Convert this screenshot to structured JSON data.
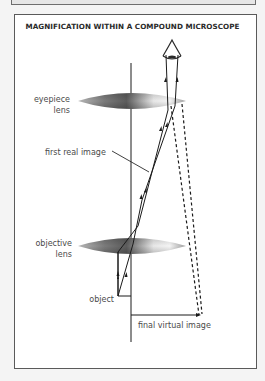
{
  "figure": {
    "title": "MAGNIFICATION WITHIN A COMPOUND MICROSCOPE",
    "labels": {
      "eyepiece_line1": "eyepiece",
      "eyepiece_line2": "lens",
      "first_real_image": "first real image",
      "objective_line1": "objective",
      "objective_line2": "lens",
      "object": "object",
      "final_virtual_image": "final virtual image"
    },
    "components": [
      {
        "name": "eye",
        "icon": "eye-icon"
      },
      {
        "name": "eyepiece lens",
        "type": "convex lens"
      },
      {
        "name": "objective lens",
        "type": "convex lens"
      },
      {
        "name": "optical axis",
        "type": "vertical line"
      },
      {
        "name": "object",
        "type": "upright arrow"
      },
      {
        "name": "first real image",
        "type": "inverted intermediate image"
      },
      {
        "name": "final virtual image",
        "type": "dashed virtual rays"
      }
    ],
    "colors": {
      "line": "#1a1a1a",
      "lens_dark": "#6a6a6a",
      "lens_light": "#f2f2f2",
      "frame_border": "#5a5a5a",
      "background": "#ffffff"
    }
  }
}
